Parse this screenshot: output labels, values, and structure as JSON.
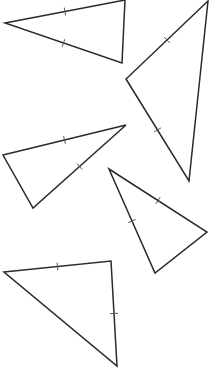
{
  "diagram": {
    "title": "Triangles with congruent side tick marks",
    "stroke_color": "#2a2a2a",
    "tick_color": "#555555",
    "background": "#ffffff",
    "triangles": [
      {
        "id": "triangle-1",
        "vertices": [
          [
            5,
            23
          ],
          [
            125,
            0
          ],
          [
            122,
            63
          ]
        ],
        "ticks": [
          {
            "edge": [
              0,
              1
            ],
            "count": 1
          },
          {
            "edge": [
              0,
              2
            ],
            "count": 1
          }
        ]
      },
      {
        "id": "triangle-2",
        "vertices": [
          [
            208,
            1
          ],
          [
            126,
            79
          ],
          [
            189,
            181
          ]
        ],
        "ticks": [
          {
            "edge": [
              0,
              1
            ],
            "count": 1
          },
          {
            "edge": [
              1,
              2
            ],
            "count": 1
          }
        ]
      },
      {
        "id": "triangle-3",
        "vertices": [
          [
            3,
            155
          ],
          [
            126,
            125
          ],
          [
            33,
            208
          ]
        ],
        "ticks": [
          {
            "edge": [
              0,
              1
            ],
            "count": 1
          },
          {
            "edge": [
              1,
              2
            ],
            "count": 1
          }
        ]
      },
      {
        "id": "triangle-4",
        "vertices": [
          [
            109,
            169
          ],
          [
            207,
            232
          ],
          [
            155,
            273
          ]
        ],
        "ticks": [
          {
            "edge": [
              0,
              1
            ],
            "count": 1
          },
          {
            "edge": [
              0,
              2
            ],
            "count": 1
          }
        ]
      },
      {
        "id": "triangle-5",
        "vertices": [
          [
            4,
            272
          ],
          [
            111,
            261
          ],
          [
            117,
            366
          ]
        ],
        "ticks": [
          {
            "edge": [
              0,
              1
            ],
            "count": 1
          },
          {
            "edge": [
              1,
              2
            ],
            "count": 1
          }
        ]
      }
    ]
  }
}
